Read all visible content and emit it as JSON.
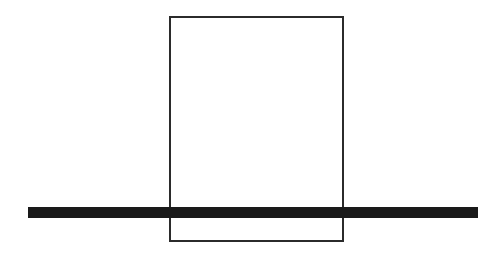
{
  "canvas": {
    "width": 502,
    "height": 262,
    "background_color": "#ffffff"
  },
  "figure": {
    "shapes": [
      {
        "id": "rectangle",
        "kind": "rectangle-outline",
        "x": 170,
        "y": 17,
        "width": 173,
        "height": 224,
        "stroke_color": "#2b2b2b",
        "stroke_width": 1.6,
        "fill": "none"
      },
      {
        "id": "horizontal-bar",
        "kind": "filled-bar",
        "x": 28,
        "y": 207,
        "width": 450,
        "height": 11,
        "fill_color": "#1a1a1a",
        "stroke_width": 0
      }
    ]
  }
}
